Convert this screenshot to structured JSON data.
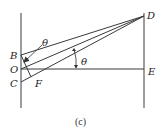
{
  "diagram": {
    "points": {
      "B": {
        "label": "B",
        "x": 21,
        "y": 55
      },
      "O": {
        "label": "O",
        "x": 21,
        "y": 69
      },
      "C": {
        "label": "C",
        "x": 21,
        "y": 82
      },
      "D": {
        "label": "D",
        "x": 144,
        "y": 16
      },
      "E": {
        "label": "E",
        "x": 144,
        "y": 69
      },
      "F": {
        "label": "F",
        "x": 31,
        "y": 78
      }
    },
    "angle_labels": {
      "upper": "θ",
      "right": "θ"
    },
    "caption": "(c)",
    "colors": {
      "line": "#3a3a3a",
      "text": "#222222",
      "background": "#ffffff"
    }
  }
}
